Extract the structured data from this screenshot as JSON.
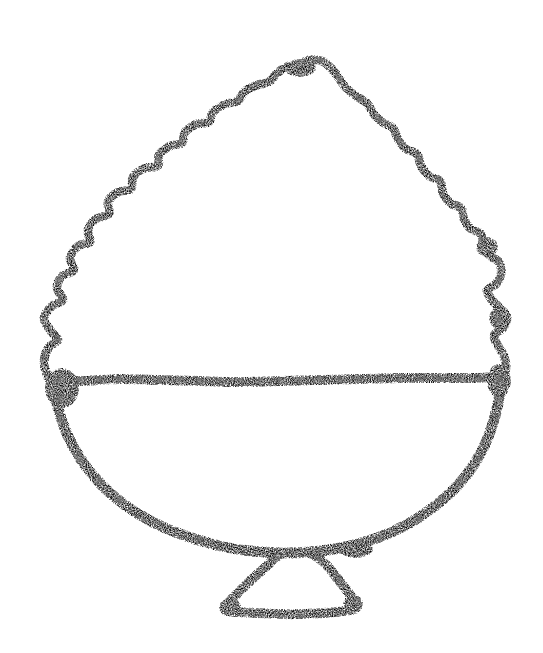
{
  "canvas": {
    "width": 543,
    "height": 653,
    "background_color": "#ffffff",
    "ink_color": "#000000",
    "medium": "charcoal-crayon-sketch",
    "subject": "dessert-cup-with-whipped-cream",
    "title": "",
    "caption": "",
    "text_content": []
  },
  "artwork": {
    "name": "hand-drawn-dessert-cup",
    "description": "Rough black charcoal line drawing of a footed dessert cup topped with a scalloped mound of whipped cream, a horizontal rim line across the middle, a rounded bowl below, and a small trapezoidal pedestal foot.",
    "stroke_texture": "grainy-speckled",
    "parts": [
      {
        "name": "whipped-cream-mound",
        "label": "Scalloped cream top",
        "bounds": {
          "x": 40,
          "y": 55,
          "width": 470,
          "height": 330
        }
      },
      {
        "name": "rim-line",
        "label": "Horizontal cup rim",
        "bounds": {
          "x": 45,
          "y": 372,
          "width": 465,
          "height": 16
        }
      },
      {
        "name": "bowl-body",
        "label": "Rounded bowl",
        "bounds": {
          "x": 52,
          "y": 380,
          "width": 450,
          "height": 182
        }
      },
      {
        "name": "pedestal-foot",
        "label": "Trapezoidal base",
        "bounds": {
          "x": 222,
          "y": 548,
          "width": 138,
          "height": 74
        }
      }
    ]
  },
  "chart_data": {
    "type": "line",
    "xlabel": "",
    "ylabel": "",
    "xlim": [
      0,
      543
    ],
    "ylim": [
      0,
      653
    ],
    "grid": false,
    "legend": "none",
    "series": [
      {
        "name": "cream-top-scalloped-outline",
        "closed": false,
        "stroke_width": 9,
        "points": [
          [
            48,
            378
          ],
          [
            44,
            362
          ],
          [
            49,
            347
          ],
          [
            58,
            340
          ],
          [
            50,
            330
          ],
          [
            44,
            318
          ],
          [
            52,
            306
          ],
          [
            63,
            300
          ],
          [
            57,
            288
          ],
          [
            62,
            276
          ],
          [
            74,
            270
          ],
          [
            70,
            258
          ],
          [
            78,
            246
          ],
          [
            90,
            242
          ],
          [
            88,
            230
          ],
          [
            96,
            219
          ],
          [
            109,
            214
          ],
          [
            108,
            202
          ],
          [
            118,
            192
          ],
          [
            131,
            189
          ],
          [
            133,
            177
          ],
          [
            145,
            168
          ],
          [
            158,
            166
          ],
          [
            159,
            155
          ],
          [
            170,
            146
          ],
          [
            182,
            143
          ],
          [
            185,
            132
          ],
          [
            197,
            124
          ],
          [
            209,
            122
          ],
          [
            213,
            112
          ],
          [
            226,
            104
          ],
          [
            238,
            101
          ],
          [
            244,
            92
          ],
          [
            257,
            85
          ],
          [
            269,
            82
          ],
          [
            277,
            73
          ],
          [
            289,
            66
          ],
          [
            300,
            64
          ],
          [
            309,
            60
          ],
          [
            322,
            61
          ],
          [
            331,
            68
          ],
          [
            339,
            78
          ],
          [
            346,
            88
          ],
          [
            356,
            96
          ],
          [
            367,
            103
          ],
          [
            373,
            113
          ],
          [
            382,
            122
          ],
          [
            393,
            128
          ],
          [
            398,
            139
          ],
          [
            406,
            149
          ],
          [
            417,
            154
          ],
          [
            421,
            166
          ],
          [
            429,
            176
          ],
          [
            440,
            181
          ],
          [
            443,
            193
          ],
          [
            450,
            203
          ],
          [
            461,
            208
          ],
          [
            464,
            219
          ],
          [
            471,
            229
          ],
          [
            481,
            234
          ],
          [
            484,
            246
          ],
          [
            490,
            256
          ],
          [
            499,
            262
          ],
          [
            501,
            274
          ],
          [
            496,
            284
          ],
          [
            487,
            290
          ],
          [
            492,
            300
          ],
          [
            500,
            308
          ],
          [
            507,
            317
          ],
          [
            503,
            328
          ],
          [
            494,
            335
          ],
          [
            498,
            346
          ],
          [
            504,
            356
          ],
          [
            506,
            368
          ],
          [
            503,
            380
          ]
        ]
      },
      {
        "name": "rim-horizontal-line",
        "closed": false,
        "stroke_width": 10,
        "points": [
          [
            50,
            380
          ],
          [
            80,
            381
          ],
          [
            120,
            379
          ],
          [
            160,
            380
          ],
          [
            200,
            381
          ],
          [
            240,
            382
          ],
          [
            280,
            381
          ],
          [
            320,
            380
          ],
          [
            360,
            379
          ],
          [
            400,
            378
          ],
          [
            440,
            378
          ],
          [
            470,
            378
          ],
          [
            500,
            377
          ]
        ]
      },
      {
        "name": "bowl-lower-curve",
        "closed": false,
        "stroke_width": 11,
        "points": [
          [
            53,
            382
          ],
          [
            58,
            408
          ],
          [
            67,
            434
          ],
          [
            80,
            458
          ],
          [
            97,
            480
          ],
          [
            117,
            499
          ],
          [
            140,
            515
          ],
          [
            165,
            528
          ],
          [
            192,
            538
          ],
          [
            220,
            546
          ],
          [
            250,
            551
          ],
          [
            280,
            553
          ],
          [
            310,
            552
          ],
          [
            340,
            548
          ],
          [
            368,
            541
          ],
          [
            394,
            531
          ],
          [
            418,
            518
          ],
          [
            440,
            502
          ],
          [
            459,
            484
          ],
          [
            475,
            463
          ],
          [
            487,
            440
          ],
          [
            495,
            416
          ],
          [
            500,
            394
          ],
          [
            502,
            380
          ]
        ]
      },
      {
        "name": "pedestal-foot-outline",
        "closed": false,
        "stroke_width": 10,
        "points": [
          [
            281,
            553
          ],
          [
            271,
            562
          ],
          [
            260,
            572
          ],
          [
            249,
            582
          ],
          [
            239,
            592
          ],
          [
            230,
            601
          ],
          [
            225,
            610
          ],
          [
            238,
            612
          ],
          [
            258,
            613
          ],
          [
            280,
            614
          ],
          [
            302,
            614
          ],
          [
            324,
            613
          ],
          [
            344,
            611
          ],
          [
            356,
            608
          ],
          [
            352,
            598
          ],
          [
            345,
            588
          ],
          [
            337,
            578
          ],
          [
            329,
            568
          ],
          [
            320,
            559
          ],
          [
            310,
            553
          ]
        ]
      }
    ]
  },
  "heavy_ink_blots": [
    {
      "name": "left-rim-junction-blot",
      "cx": 62,
      "cy": 388,
      "rx": 17,
      "ry": 20
    },
    {
      "name": "right-rim-junction-blot",
      "cx": 499,
      "cy": 381,
      "rx": 12,
      "ry": 17
    },
    {
      "name": "bowl-right-foot-blot",
      "cx": 356,
      "cy": 549,
      "rx": 17,
      "ry": 9
    },
    {
      "name": "foot-left-corner-blot",
      "cx": 230,
      "cy": 607,
      "rx": 11,
      "ry": 9
    },
    {
      "name": "foot-right-corner-blot",
      "cx": 353,
      "cy": 604,
      "rx": 10,
      "ry": 10
    },
    {
      "name": "cream-apex-blot",
      "cx": 300,
      "cy": 68,
      "rx": 16,
      "ry": 9
    },
    {
      "name": "right-upper-blot",
      "cx": 487,
      "cy": 247,
      "rx": 11,
      "ry": 10
    },
    {
      "name": "right-notch-blot",
      "cx": 499,
      "cy": 318,
      "rx": 10,
      "ry": 11
    }
  ]
}
